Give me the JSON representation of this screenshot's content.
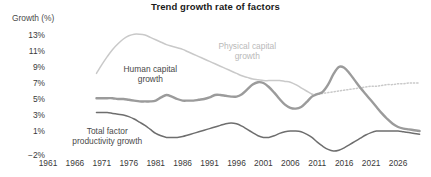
{
  "chart_data": {
    "type": "line",
    "title": "Trend growth rate of factors",
    "ylabel": "Growth (%)",
    "xlabel": "",
    "ylim": [
      -2,
      14
    ],
    "xlim": [
      1961,
      2031
    ],
    "grid": false,
    "legend_position": "inline-annotations",
    "ytick_labels": [
      "13%",
      "11%",
      "9%",
      "7%",
      "5%",
      "3%",
      "1%",
      "−2%"
    ],
    "ytick_values": [
      13,
      11,
      9,
      7,
      5,
      3,
      1,
      -2
    ],
    "xtick_labels": [
      "1961",
      "1966",
      "1971",
      "1976",
      "1981",
      "1986",
      "1991",
      "1996",
      "2001",
      "2006",
      "2011",
      "2016",
      "2021",
      "2026"
    ],
    "xtick_values": [
      1961,
      1966,
      1971,
      1976,
      1981,
      1986,
      1991,
      1996,
      2001,
      2006,
      2011,
      2016,
      2021,
      2026
    ],
    "series": [
      {
        "name": "Physical capital growth",
        "color": "#c9c9c9",
        "width": 1.5,
        "annotation": "Physical capital\ngrowth",
        "annotation_line1": "Physical capital",
        "annotation_line2": "growth",
        "x": [
          1970,
          1971,
          1972,
          1973,
          1974,
          1975,
          1976,
          1977,
          1978,
          1979,
          1980,
          1981,
          1982,
          1983,
          1984,
          1985,
          1986,
          1987,
          1988,
          1989,
          1990,
          1991,
          1992,
          1993,
          1994,
          1995,
          1996,
          1997,
          1998,
          1999,
          2000,
          2001,
          2002,
          2003,
          2004,
          2005,
          2006,
          2007,
          2008,
          2009,
          2010
        ],
        "y": [
          8.2,
          9.3,
          10.3,
          11.2,
          11.9,
          12.5,
          12.9,
          13.1,
          13.1,
          13.0,
          12.7,
          12.4,
          12.1,
          11.8,
          11.6,
          11.4,
          11.2,
          10.9,
          10.6,
          10.3,
          10.0,
          9.7,
          9.4,
          9.1,
          8.8,
          8.5,
          8.2,
          7.9,
          7.7,
          7.5,
          7.4,
          7.3,
          7.3,
          7.3,
          7.3,
          7.2,
          7.1,
          6.8,
          6.4,
          6.0,
          5.6
        ],
        "x_projected": [
          2010,
          2011,
          2012,
          2013,
          2014,
          2015,
          2016,
          2017,
          2018,
          2019,
          2020,
          2021,
          2022,
          2023,
          2024,
          2025,
          2026,
          2027,
          2028,
          2029,
          2030
        ],
        "y_projected": [
          5.6,
          5.6,
          5.7,
          5.8,
          5.9,
          6.0,
          6.1,
          6.2,
          6.3,
          6.4,
          6.5,
          6.6,
          6.6,
          6.7,
          6.8,
          6.8,
          6.9,
          6.9,
          7.0,
          7.0,
          7.0
        ],
        "style_historical": "solid",
        "style_projected": "dotted",
        "projection_start_year": 2010
      },
      {
        "name": "Human capital growth",
        "color": "#9b9b9b",
        "width": 2.4,
        "annotation": "Human capital\ngrowth",
        "annotation_line1": "Human capital",
        "annotation_line2": "growth",
        "x": [
          1970,
          1971,
          1972,
          1973,
          1974,
          1975,
          1976,
          1977,
          1978,
          1979,
          1980,
          1981,
          1982,
          1983,
          1984,
          1985,
          1986,
          1987,
          1988,
          1989,
          1990,
          1991,
          1992,
          1993,
          1994,
          1995,
          1996,
          1997,
          1998,
          1999,
          2000,
          2001,
          2002,
          2003,
          2004,
          2005,
          2006,
          2007,
          2008,
          2009,
          2010,
          2011,
          2012,
          2013,
          2014,
          2015,
          2016,
          2017,
          2018,
          2019,
          2020,
          2021,
          2022,
          2023,
          2024,
          2025,
          2026,
          2027,
          2028,
          2029,
          2030
        ],
        "y": [
          5.1,
          5.1,
          5.1,
          5.1,
          5.0,
          5.0,
          4.9,
          4.8,
          4.7,
          4.7,
          4.7,
          4.8,
          5.2,
          5.5,
          5.3,
          5.0,
          4.8,
          4.8,
          4.8,
          4.9,
          5.0,
          5.2,
          5.5,
          5.5,
          5.4,
          5.3,
          5.3,
          5.6,
          6.2,
          6.8,
          7.1,
          7.0,
          6.5,
          5.8,
          5.0,
          4.3,
          3.9,
          3.8,
          4.0,
          4.6,
          5.3,
          5.6,
          5.9,
          6.8,
          8.1,
          9.0,
          8.9,
          8.2,
          7.3,
          6.4,
          5.6,
          4.8,
          4.0,
          3.2,
          2.5,
          1.9,
          1.5,
          1.3,
          1.2,
          1.1,
          1.0
        ],
        "style_historical": "solid",
        "peak_year": 2015,
        "peak_value": 9.0
      },
      {
        "name": "Total factor productivity growth",
        "color": "#6e6e6e",
        "width": 1.5,
        "annotation": "Total factor\nproductivity growth",
        "annotation_line1": "Total factor",
        "annotation_line2": "productivity growth",
        "x": [
          1970,
          1971,
          1972,
          1973,
          1974,
          1975,
          1976,
          1977,
          1978,
          1979,
          1980,
          1981,
          1982,
          1983,
          1984,
          1985,
          1986,
          1987,
          1988,
          1989,
          1990,
          1991,
          1992,
          1993,
          1994,
          1995,
          1996,
          1997,
          1998,
          1999,
          2000,
          2001,
          2002,
          2003,
          2004,
          2005,
          2006,
          2007,
          2008,
          2009,
          2010,
          2011,
          2012,
          2013,
          2014,
          2015,
          2016,
          2017,
          2018,
          2019,
          2020,
          2021,
          2022,
          2023,
          2024,
          2025,
          2026,
          2027,
          2028,
          2029,
          2030
        ],
        "y": [
          3.3,
          3.3,
          3.3,
          3.2,
          3.1,
          3.0,
          2.8,
          2.5,
          2.1,
          1.7,
          1.2,
          0.7,
          0.4,
          0.2,
          0.2,
          0.2,
          0.3,
          0.5,
          0.7,
          0.9,
          1.1,
          1.3,
          1.5,
          1.7,
          1.9,
          2.0,
          1.9,
          1.6,
          1.2,
          0.8,
          0.4,
          0.2,
          0.2,
          0.4,
          0.7,
          0.9,
          1.0,
          1.0,
          0.9,
          0.6,
          0.2,
          -0.4,
          -0.9,
          -1.3,
          -1.5,
          -1.4,
          -1.1,
          -0.7,
          -0.3,
          0.1,
          0.5,
          0.8,
          1.0,
          1.0,
          1.0,
          1.0,
          1.0,
          0.9,
          0.8,
          0.7,
          0.6
        ],
        "style_historical": "solid",
        "trough_year": 2014,
        "trough_value": -1.5
      }
    ]
  }
}
